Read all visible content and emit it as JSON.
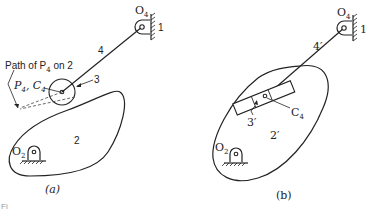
{
  "diagram": {
    "type": "cam-follower equivalent linkage",
    "figure_a": {
      "caption": "(a)",
      "labels": {
        "path_label": "Path of P",
        "path_sub": "4",
        "path_suffix": " on 2",
        "point_label": "P",
        "point_sub": "4",
        "point_sep": ", C",
        "point_sub2": "4",
        "link_4": "4",
        "roller_3": "3",
        "cam_2": "2",
        "pivot_o2": "O",
        "pivot_o2_sub": "2",
        "pivot_o4": "O",
        "pivot_o4_sub": "4",
        "frame_1": "1"
      }
    },
    "figure_b": {
      "caption": "(b)",
      "labels": {
        "link_4": "4′",
        "slider_3": "3′",
        "body_2": "2′",
        "point_c4": "C",
        "point_c4_sub": "4",
        "pivot_o2": "O",
        "pivot_o2_sub": "2",
        "pivot_o4": "O",
        "pivot_o4_sub": "4",
        "frame_1": "1"
      }
    },
    "footer_text": "Fi"
  }
}
